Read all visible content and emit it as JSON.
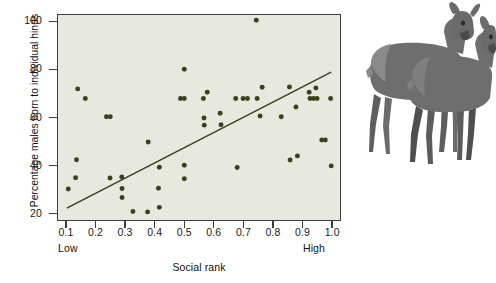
{
  "figure": {
    "illustration_name": "two-red-deer-hinds",
    "illustration_alt": "Two red deer hinds standing"
  },
  "colors": {
    "plot_background": "#e8e9de",
    "point_fill": "#3c401f",
    "line_color": "#3a4020",
    "frame": "#3d3d3d",
    "text": "#111111",
    "deer_body": "#6e6e6e",
    "deer_shadow": "#4a4a4a",
    "deer_light": "#8a8a8a"
  },
  "chart_data": {
    "type": "scatter",
    "title": "",
    "xlabel": "Social rank",
    "ylabel": "Percentage males born to individual hinds",
    "xlim": [
      0.07,
      1.03
    ],
    "ylim": [
      17,
      103
    ],
    "grid": false,
    "legend": null,
    "x_ticks": [
      "0.1",
      "0.2",
      "0.3",
      "0.4",
      "0.5",
      "0.6",
      "0.7",
      "0.8",
      "0.9",
      "1.0"
    ],
    "x_tick_values": [
      0.1,
      0.2,
      0.3,
      0.4,
      0.5,
      0.6,
      0.7,
      0.8,
      0.9,
      1.0
    ],
    "x_end_labels": {
      "left": "Low",
      "right": "High"
    },
    "y_ticks": [
      "20",
      "40",
      "60",
      "80",
      "100"
    ],
    "y_tick_values": [
      20,
      40,
      60,
      80,
      100
    ],
    "points": [
      [
        0.105,
        30.0
      ],
      [
        0.13,
        34.7
      ],
      [
        0.133,
        42.3
      ],
      [
        0.137,
        72.0
      ],
      [
        0.163,
        68.0
      ],
      [
        0.235,
        60.3
      ],
      [
        0.248,
        60.3
      ],
      [
        0.247,
        34.6
      ],
      [
        0.287,
        35.0
      ],
      [
        0.288,
        30.2
      ],
      [
        0.288,
        26.4
      ],
      [
        0.325,
        20.6
      ],
      [
        0.375,
        20.4
      ],
      [
        0.377,
        49.7
      ],
      [
        0.412,
        30.3
      ],
      [
        0.415,
        22.3
      ],
      [
        0.415,
        39.1
      ],
      [
        0.487,
        68.0
      ],
      [
        0.5,
        68.0
      ],
      [
        0.5,
        80.2
      ],
      [
        0.5,
        40.0
      ],
      [
        0.5,
        34.3
      ],
      [
        0.565,
        68.0
      ],
      [
        0.567,
        59.8
      ],
      [
        0.568,
        56.8
      ],
      [
        0.578,
        70.6
      ],
      [
        0.622,
        61.8
      ],
      [
        0.625,
        57.0
      ],
      [
        0.675,
        68.0
      ],
      [
        0.68,
        39.0
      ],
      [
        0.7,
        68.0
      ],
      [
        0.715,
        68.0
      ],
      [
        0.748,
        68.0
      ],
      [
        0.745,
        100.8
      ],
      [
        0.758,
        60.6
      ],
      [
        0.765,
        72.7
      ],
      [
        0.83,
        60.3
      ],
      [
        0.858,
        72.8
      ],
      [
        0.86,
        42.2
      ],
      [
        0.88,
        64.4
      ],
      [
        0.885,
        43.9
      ],
      [
        0.925,
        70.6
      ],
      [
        0.928,
        68.0
      ],
      [
        0.94,
        68.0
      ],
      [
        0.948,
        72.4
      ],
      [
        0.952,
        68.0
      ],
      [
        0.968,
        50.6
      ],
      [
        0.98,
        50.6
      ],
      [
        0.998,
        68.0
      ],
      [
        1.0,
        39.7
      ]
    ],
    "trend_line": {
      "type": "linear_fit",
      "x_start": 0.1,
      "y_start": 22.0,
      "x_end": 1.0,
      "y_end": 79.0
    }
  }
}
